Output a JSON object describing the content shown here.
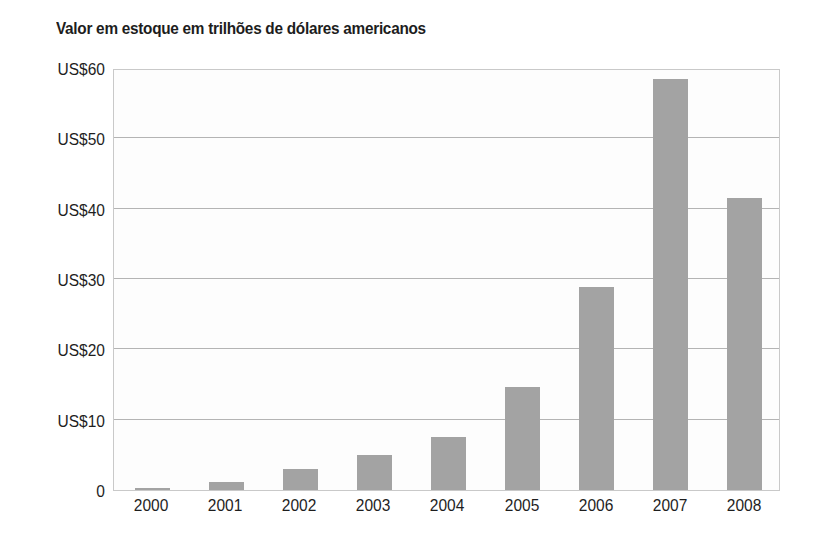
{
  "chart_data": {
    "type": "bar",
    "title": "Valor em estoque em trilhões de dólares americanos",
    "xlabel": "",
    "ylabel": "",
    "categories": [
      "2000",
      "2001",
      "2002",
      "2003",
      "2004",
      "2005",
      "2006",
      "2007",
      "2008"
    ],
    "values": [
      0.3,
      1.2,
      3.0,
      5.0,
      7.6,
      14.7,
      28.8,
      58.4,
      41.5
    ],
    "ylim": [
      0,
      60
    ],
    "yticks": [
      0,
      10,
      20,
      30,
      40,
      50,
      60
    ],
    "ytick_labels": [
      "0",
      "US$10",
      "US$20",
      "US$30",
      "US$40",
      "US$50",
      "US$60"
    ],
    "grid": true,
    "legend": "none",
    "bar_color": "#a3a3a3",
    "grid_color": "#b4b4b4",
    "plot_border_color": "#c9c9c9",
    "plot_background": "#fdfdfd",
    "text_color": "#1e1e1e",
    "page_background": "#ffffff"
  }
}
